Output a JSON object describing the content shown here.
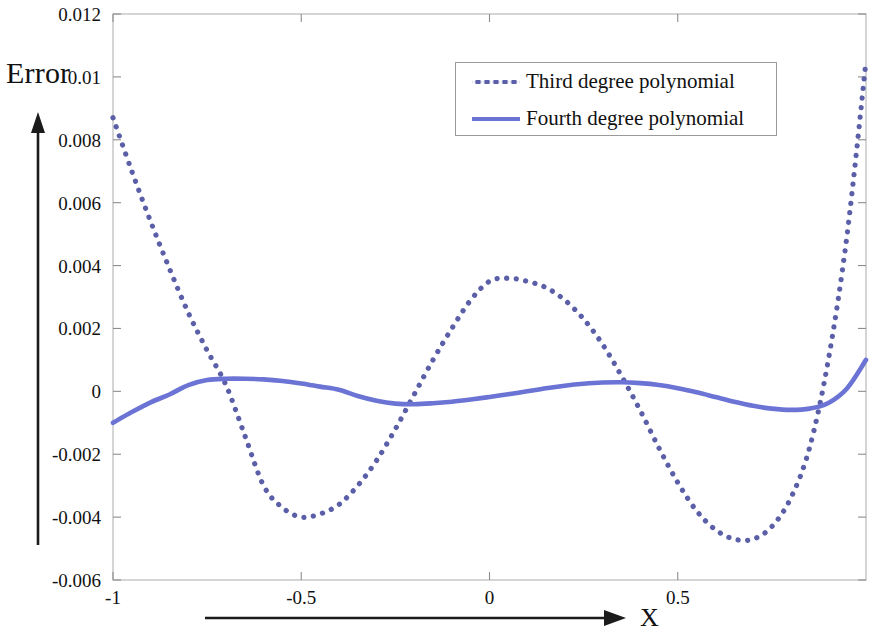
{
  "figure": {
    "background": "#ffffff",
    "axis_title_y": "Error",
    "axis_title_x": "X"
  },
  "legend": {
    "entries": [
      {
        "label": "Third degree polynomial",
        "style": "dotted",
        "color": "#5a5fa8"
      },
      {
        "label": "Fourth degree polynomial",
        "style": "solid",
        "color": "#6b74d4"
      }
    ]
  },
  "axes": {
    "y_ticks": [
      "0.012",
      "0.01",
      "0.008",
      "0.006",
      "0.004",
      "0.002",
      "0",
      "-0.002",
      "-0.004",
      "-0.006"
    ],
    "x_ticks": [
      "-1",
      "-0.5",
      "0",
      "0.5"
    ]
  },
  "chart_data": {
    "type": "line",
    "title": "",
    "xlabel": "X",
    "ylabel": "Error",
    "xlim": [
      -1,
      1
    ],
    "ylim": [
      -0.006,
      0.012
    ],
    "grid": false,
    "legend_position": "top-center-right",
    "xticks": [
      -1,
      -0.5,
      0,
      0.5
    ],
    "yticks": [
      -0.006,
      -0.004,
      -0.002,
      0,
      0.002,
      0.004,
      0.006,
      0.008,
      0.01,
      0.012
    ],
    "series": [
      {
        "name": "Third degree polynomial",
        "style": "dotted",
        "color": "#5a5fa8",
        "x": [
          -1.0,
          -0.95,
          -0.9,
          -0.85,
          -0.8,
          -0.75,
          -0.7,
          -0.65,
          -0.6,
          -0.55,
          -0.5,
          -0.45,
          -0.4,
          -0.35,
          -0.3,
          -0.25,
          -0.2,
          -0.15,
          -0.1,
          -0.05,
          0.0,
          0.05,
          0.1,
          0.15,
          0.2,
          0.25,
          0.3,
          0.35,
          0.4,
          0.45,
          0.5,
          0.55,
          0.6,
          0.65,
          0.7,
          0.75,
          0.8,
          0.85,
          0.9,
          0.95,
          1.0
        ],
        "y": [
          0.0087,
          0.007,
          0.0054,
          0.0039,
          0.0025,
          0.0013,
          0.0002,
          -0.0014,
          -0.003,
          -0.0037,
          -0.004,
          -0.0039,
          -0.0036,
          -0.003,
          -0.0022,
          -0.0012,
          -0.0001,
          0.001,
          0.002,
          0.0029,
          0.0035,
          0.0036,
          0.0035,
          0.0033,
          0.0029,
          0.0023,
          0.0015,
          0.0005,
          -0.0006,
          -0.0018,
          -0.0029,
          -0.0038,
          -0.0044,
          -0.0047,
          -0.0047,
          -0.0043,
          -0.0034,
          -0.0018,
          0.001,
          0.005,
          0.0105
        ]
      },
      {
        "name": "Fourth degree polynomial",
        "style": "solid",
        "color": "#6b74d4",
        "x": [
          -1.0,
          -0.95,
          -0.9,
          -0.85,
          -0.8,
          -0.75,
          -0.7,
          -0.65,
          -0.6,
          -0.55,
          -0.5,
          -0.45,
          -0.4,
          -0.35,
          -0.3,
          -0.25,
          -0.2,
          -0.15,
          -0.1,
          -0.05,
          0.0,
          0.05,
          0.1,
          0.15,
          0.2,
          0.25,
          0.3,
          0.35,
          0.4,
          0.45,
          0.5,
          0.55,
          0.6,
          0.65,
          0.7,
          0.75,
          0.8,
          0.85,
          0.9,
          0.95,
          1.0
        ],
        "y": [
          -0.001,
          -0.00066,
          -0.00035,
          -0.0001,
          0.0002,
          0.00036,
          0.0004,
          0.0004,
          0.00038,
          0.00033,
          0.00025,
          0.00015,
          5e-05,
          -0.00015,
          -0.0003,
          -0.00039,
          -0.00041,
          -0.00038,
          -0.00033,
          -0.00026,
          -0.00018,
          -9e-05,
          0.0,
          0.0001,
          0.00018,
          0.00024,
          0.00028,
          0.00029,
          0.00026,
          0.0002,
          0.0001,
          -3e-05,
          -0.00018,
          -0.00033,
          -0.00046,
          -0.00055,
          -0.00059,
          -0.00055,
          -0.00037,
          0.0001,
          0.001
        ]
      }
    ],
    "annotations": [
      {
        "text": "Error",
        "role": "y-axis-title"
      },
      {
        "text": "X",
        "role": "x-axis-title"
      }
    ]
  }
}
